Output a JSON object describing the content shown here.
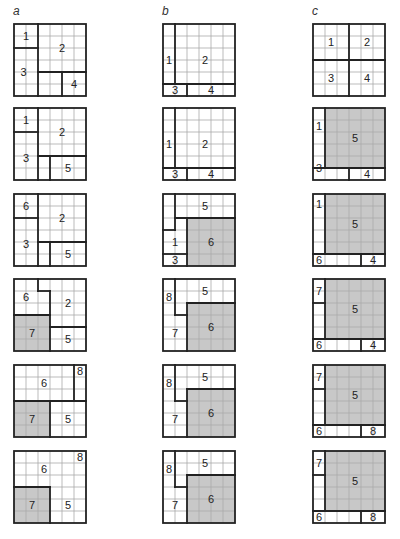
{
  "columns": [
    {
      "label": "a",
      "x": 13
    },
    {
      "label": "b",
      "x": 162
    },
    {
      "label": "c",
      "x": 312
    }
  ],
  "row_y": [
    23,
    107,
    193,
    278,
    364,
    450
  ],
  "grid": {
    "cells": 6,
    "cell_px": 12,
    "thin_color": "#aaaaaa",
    "thick_color": "#222222",
    "shade_color": "#c8c8c8"
  },
  "panels": [
    {
      "col": 0,
      "row": 0,
      "shaded": [],
      "thick": [
        [
          2,
          0,
          2,
          6
        ],
        [
          0,
          2,
          2,
          2
        ],
        [
          2,
          4,
          6,
          4
        ],
        [
          4,
          4,
          4,
          6
        ]
      ],
      "labels": [
        {
          "t": "1",
          "x": 1,
          "y": 1
        },
        {
          "t": "2",
          "x": 4,
          "y": 2
        },
        {
          "t": "3",
          "x": 0.8,
          "y": 4
        },
        {
          "t": "4",
          "x": 5,
          "y": 5
        }
      ]
    },
    {
      "col": 1,
      "row": 0,
      "shaded": [],
      "thick": [
        [
          1,
          0,
          1,
          5
        ],
        [
          0,
          5,
          6,
          5
        ],
        [
          2,
          5,
          2,
          6
        ]
      ],
      "labels": [
        {
          "t": "1",
          "x": 0.5,
          "y": 3
        },
        {
          "t": "2",
          "x": 3.5,
          "y": 3
        },
        {
          "t": "3",
          "x": 1,
          "y": 5.5
        },
        {
          "t": "4",
          "x": 4,
          "y": 5.5
        }
      ]
    },
    {
      "col": 2,
      "row": 0,
      "shaded": [],
      "thick": [
        [
          3,
          0,
          3,
          6
        ],
        [
          0,
          3,
          6,
          3
        ]
      ],
      "labels": [
        {
          "t": "1",
          "x": 1.5,
          "y": 1.5
        },
        {
          "t": "2",
          "x": 4.5,
          "y": 1.5
        },
        {
          "t": "3",
          "x": 1.5,
          "y": 4.5
        },
        {
          "t": "4",
          "x": 4.5,
          "y": 4.5
        }
      ]
    },
    {
      "col": 0,
      "row": 1,
      "shaded": [],
      "thick": [
        [
          2,
          0,
          2,
          6
        ],
        [
          0,
          2,
          2,
          2
        ],
        [
          2,
          4,
          6,
          4
        ],
        [
          3,
          4,
          3,
          6
        ]
      ],
      "labels": [
        {
          "t": "1",
          "x": 1,
          "y": 1
        },
        {
          "t": "2",
          "x": 4,
          "y": 2
        },
        {
          "t": "3",
          "x": 1,
          "y": 4.2
        },
        {
          "t": "5",
          "x": 4.5,
          "y": 5
        }
      ]
    },
    {
      "col": 1,
      "row": 1,
      "shaded": [],
      "thick": [
        [
          1,
          0,
          1,
          5
        ],
        [
          0,
          5,
          6,
          5
        ],
        [
          2,
          5,
          2,
          6
        ]
      ],
      "labels": [
        {
          "t": "1",
          "x": 0.5,
          "y": 3
        },
        {
          "t": "2",
          "x": 3.5,
          "y": 3
        },
        {
          "t": "3",
          "x": 1,
          "y": 5.5
        },
        {
          "t": "4",
          "x": 4,
          "y": 5.5
        }
      ]
    },
    {
      "col": 2,
      "row": 1,
      "shaded": [
        [
          1,
          0,
          5,
          5
        ]
      ],
      "thick": [
        [
          1,
          0,
          1,
          5
        ],
        [
          0,
          5,
          6,
          5
        ],
        [
          3,
          5,
          3,
          6
        ]
      ],
      "labels": [
        {
          "t": "1",
          "x": 0.5,
          "y": 1.5
        },
        {
          "t": "5",
          "x": 3.5,
          "y": 2.5
        },
        {
          "t": "3",
          "x": 0.5,
          "y": 5
        },
        {
          "t": "4",
          "x": 4.5,
          "y": 5.5
        }
      ]
    },
    {
      "col": 0,
      "row": 2,
      "shaded": [],
      "thick": [
        [
          2,
          0,
          2,
          6
        ],
        [
          0,
          2,
          2,
          2
        ],
        [
          2,
          4,
          6,
          4
        ],
        [
          3,
          4,
          3,
          6
        ]
      ],
      "labels": [
        {
          "t": "6",
          "x": 1,
          "y": 1
        },
        {
          "t": "2",
          "x": 4,
          "y": 2
        },
        {
          "t": "3",
          "x": 1,
          "y": 4.2
        },
        {
          "t": "5",
          "x": 4.5,
          "y": 5
        }
      ]
    },
    {
      "col": 1,
      "row": 2,
      "shaded": [
        [
          2,
          2,
          4,
          4
        ]
      ],
      "thick": [
        [
          1,
          0,
          1,
          3
        ],
        [
          1,
          2,
          6,
          2
        ],
        [
          2,
          2,
          2,
          6
        ],
        [
          0,
          3,
          1,
          3
        ],
        [
          0,
          5,
          2,
          5
        ]
      ],
      "labels": [
        {
          "t": "5",
          "x": 3.5,
          "y": 1
        },
        {
          "t": "6",
          "x": 4,
          "y": 4
        },
        {
          "t": "1",
          "x": 1,
          "y": 4
        },
        {
          "t": "3",
          "x": 1,
          "y": 5.5
        }
      ]
    },
    {
      "col": 2,
      "row": 2,
      "shaded": [
        [
          1,
          0,
          5,
          5
        ]
      ],
      "thick": [
        [
          1,
          0,
          1,
          5
        ],
        [
          0,
          5,
          6,
          5
        ],
        [
          4,
          5,
          4,
          6
        ]
      ],
      "labels": [
        {
          "t": "1",
          "x": 0.5,
          "y": 0.8
        },
        {
          "t": "5",
          "x": 3.5,
          "y": 2.5
        },
        {
          "t": "6",
          "x": 0.5,
          "y": 5.5
        },
        {
          "t": "4",
          "x": 5,
          "y": 5.5
        }
      ]
    },
    {
      "col": 0,
      "row": 3,
      "shaded": [
        [
          0,
          3,
          3,
          3
        ]
      ],
      "thick": [
        [
          2,
          0,
          2,
          1
        ],
        [
          2,
          1,
          3,
          1
        ],
        [
          3,
          1,
          3,
          6
        ],
        [
          0,
          3,
          3,
          3
        ],
        [
          3,
          4,
          6,
          4
        ]
      ],
      "labels": [
        {
          "t": "6",
          "x": 1,
          "y": 1.5
        },
        {
          "t": "2",
          "x": 4.5,
          "y": 2
        },
        {
          "t": "7",
          "x": 1.5,
          "y": 4.5
        },
        {
          "t": "5",
          "x": 4.5,
          "y": 5
        }
      ]
    },
    {
      "col": 1,
      "row": 3,
      "shaded": [
        [
          2,
          2,
          4,
          4
        ]
      ],
      "thick": [
        [
          1,
          0,
          1,
          3
        ],
        [
          1,
          3,
          2,
          3
        ],
        [
          2,
          2,
          6,
          2
        ],
        [
          2,
          2,
          2,
          6
        ]
      ],
      "labels": [
        {
          "t": "8",
          "x": 0.5,
          "y": 1.5
        },
        {
          "t": "5",
          "x": 3.5,
          "y": 1
        },
        {
          "t": "7",
          "x": 1,
          "y": 4.5
        },
        {
          "t": "6",
          "x": 4,
          "y": 4
        }
      ]
    },
    {
      "col": 2,
      "row": 3,
      "shaded": [
        [
          1,
          0,
          5,
          5
        ]
      ],
      "thick": [
        [
          1,
          0,
          1,
          5
        ],
        [
          0,
          5,
          6,
          5
        ],
        [
          4,
          5,
          4,
          6
        ],
        [
          0,
          2,
          1,
          2
        ]
      ],
      "labels": [
        {
          "t": "7",
          "x": 0.5,
          "y": 1
        },
        {
          "t": "5",
          "x": 3.5,
          "y": 2.5
        },
        {
          "t": "6",
          "x": 0.5,
          "y": 5.5
        },
        {
          "t": "4",
          "x": 5,
          "y": 5.5
        }
      ]
    },
    {
      "col": 0,
      "row": 4,
      "shaded": [
        [
          0,
          3,
          3,
          3
        ]
      ],
      "thick": [
        [
          5,
          0,
          5,
          3
        ],
        [
          0,
          3,
          6,
          3
        ],
        [
          3,
          3,
          3,
          6
        ]
      ],
      "labels": [
        {
          "t": "8",
          "x": 5.5,
          "y": 0.5
        },
        {
          "t": "6",
          "x": 2.5,
          "y": 1.5
        },
        {
          "t": "7",
          "x": 1.5,
          "y": 4.5
        },
        {
          "t": "5",
          "x": 4.5,
          "y": 4.5
        }
      ]
    },
    {
      "col": 1,
      "row": 4,
      "shaded": [
        [
          2,
          2,
          4,
          4
        ]
      ],
      "thick": [
        [
          1,
          0,
          1,
          3
        ],
        [
          1,
          3,
          2,
          3
        ],
        [
          2,
          2,
          6,
          2
        ],
        [
          2,
          2,
          2,
          6
        ]
      ],
      "labels": [
        {
          "t": "8",
          "x": 0.5,
          "y": 1.5
        },
        {
          "t": "5",
          "x": 3.5,
          "y": 1
        },
        {
          "t": "7",
          "x": 1,
          "y": 4.5
        },
        {
          "t": "6",
          "x": 4,
          "y": 4
        }
      ]
    },
    {
      "col": 2,
      "row": 4,
      "shaded": [
        [
          1,
          0,
          5,
          5
        ]
      ],
      "thick": [
        [
          1,
          0,
          1,
          5
        ],
        [
          0,
          5,
          6,
          5
        ],
        [
          4,
          5,
          4,
          6
        ],
        [
          0,
          2,
          1,
          2
        ]
      ],
      "labels": [
        {
          "t": "7",
          "x": 0.5,
          "y": 1
        },
        {
          "t": "5",
          "x": 3.5,
          "y": 2.5
        },
        {
          "t": "6",
          "x": 0.5,
          "y": 5.5
        },
        {
          "t": "8",
          "x": 5,
          "y": 5.5
        }
      ]
    },
    {
      "col": 0,
      "row": 5,
      "shaded": [
        [
          0,
          3,
          3,
          3
        ]
      ],
      "thick": [
        [
          0,
          3,
          3,
          3
        ],
        [
          3,
          3,
          3,
          6
        ]
      ],
      "labels": [
        {
          "t": "8",
          "x": 5.5,
          "y": 0.5
        },
        {
          "t": "6",
          "x": 2.5,
          "y": 1.5
        },
        {
          "t": "7",
          "x": 1.5,
          "y": 4.5
        },
        {
          "t": "5",
          "x": 4.5,
          "y": 4.5
        }
      ]
    },
    {
      "col": 1,
      "row": 5,
      "shaded": [
        [
          2,
          2,
          4,
          4
        ]
      ],
      "thick": [
        [
          1,
          0,
          1,
          3
        ],
        [
          1,
          3,
          2,
          3
        ],
        [
          2,
          2,
          6,
          2
        ],
        [
          2,
          2,
          2,
          6
        ]
      ],
      "labels": [
        {
          "t": "8",
          "x": 0.5,
          "y": 1.5
        },
        {
          "t": "5",
          "x": 3.5,
          "y": 1
        },
        {
          "t": "7",
          "x": 1,
          "y": 4.5
        },
        {
          "t": "6",
          "x": 4,
          "y": 4
        }
      ]
    },
    {
      "col": 2,
      "row": 5,
      "shaded": [
        [
          1,
          0,
          5,
          5
        ]
      ],
      "thick": [
        [
          1,
          0,
          1,
          5
        ],
        [
          0,
          5,
          6,
          5
        ],
        [
          4,
          5,
          4,
          6
        ],
        [
          0,
          2,
          1,
          2
        ]
      ],
      "labels": [
        {
          "t": "7",
          "x": 0.5,
          "y": 1
        },
        {
          "t": "5",
          "x": 3.5,
          "y": 2.5
        },
        {
          "t": "6",
          "x": 0.5,
          "y": 5.5
        },
        {
          "t": "8",
          "x": 5,
          "y": 5.5
        }
      ]
    }
  ]
}
